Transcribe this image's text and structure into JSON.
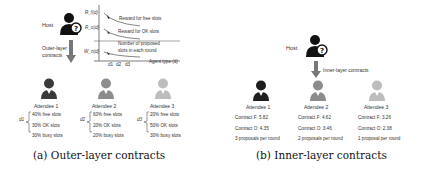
{
  "outer": {
    "host_label": "Host",
    "arrow_label_line1": "Outer-layer",
    "arrow_label_line2": "contracts",
    "chart": {
      "y_labels": [
        "R_f(d)",
        "R_o(d)",
        "W_n(d)"
      ],
      "curve_labels": [
        "Reward for free slots",
        "Reward for OK slots",
        "Number of proposed",
        "slots in each round"
      ],
      "x_ticks": [
        "d1",
        "d2",
        "d3"
      ],
      "x_label": "Agent type (d)"
    },
    "attendees": [
      {
        "name": "Attendee 1",
        "type": "d1",
        "free": "40% free slots",
        "ok": "30% OK slots",
        "busy": "30% busy slots",
        "color": "#3a3a3a"
      },
      {
        "name": "Attendee 2",
        "type": "d2",
        "free": "60% free slots",
        "ok": "20% OK slots",
        "busy": "20% busy slots",
        "color": "#8c8c8c"
      },
      {
        "name": "Attendee 3",
        "type": "d3",
        "free": "20% free slots",
        "ok": "50% OK slots",
        "busy": "30% busy slots",
        "color": "#bdbdbd"
      }
    ],
    "caption": "(a) Outer-layer contracts"
  },
  "inner": {
    "host_label": "Host",
    "arrow_label": "Inner-layer contracts",
    "attendees": [
      {
        "name": "Attendee 1",
        "contract_f": "Contract F: 5.82",
        "contract_o": "Contract O: 4.35",
        "proposals": "3 proposals per round",
        "color": "#1e1e1e"
      },
      {
        "name": "Attendee 2",
        "contract_f": "Contract F: 4.62",
        "contract_o": "Contract O: 3.46",
        "proposals": "2 proposals per round",
        "color": "#8c8c8c"
      },
      {
        "name": "Attendee 3",
        "contract_f": "Contract F: 3.26",
        "contract_o": "Contract O: 2.38",
        "proposals": "1 proposal per round",
        "color": "#bdbdbd"
      }
    ],
    "caption": "(b) Inner-layer contracts"
  }
}
